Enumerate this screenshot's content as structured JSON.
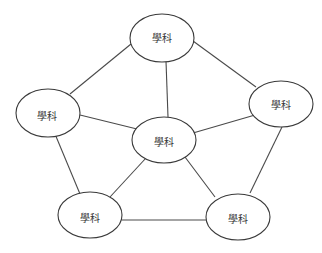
{
  "diagram": {
    "nodes": [
      {
        "id": "top",
        "label": "學科",
        "cx": 162,
        "cy": 38,
        "rx": 32,
        "ry": 24
      },
      {
        "id": "left",
        "label": "學科",
        "cx": 48,
        "cy": 113,
        "rx": 32,
        "ry": 24
      },
      {
        "id": "right",
        "label": "學科",
        "cx": 281,
        "cy": 104,
        "rx": 32,
        "ry": 23
      },
      {
        "id": "center",
        "label": "學科",
        "cx": 164,
        "cy": 140,
        "rx": 32,
        "ry": 23
      },
      {
        "id": "bottom-left",
        "label": "學科",
        "cx": 90,
        "cy": 215,
        "rx": 32,
        "ry": 23
      },
      {
        "id": "bottom-right",
        "label": "學科",
        "cx": 238,
        "cy": 217,
        "rx": 32,
        "ry": 23
      }
    ],
    "edges": [
      {
        "from": "top",
        "to": "left"
      },
      {
        "from": "top",
        "to": "right"
      },
      {
        "from": "top",
        "to": "center"
      },
      {
        "from": "left",
        "to": "center"
      },
      {
        "from": "right",
        "to": "center"
      },
      {
        "from": "left",
        "to": "bottom-left"
      },
      {
        "from": "right",
        "to": "bottom-right"
      },
      {
        "from": "center",
        "to": "bottom-left"
      },
      {
        "from": "center",
        "to": "bottom-right"
      },
      {
        "from": "bottom-left",
        "to": "bottom-right"
      }
    ]
  }
}
